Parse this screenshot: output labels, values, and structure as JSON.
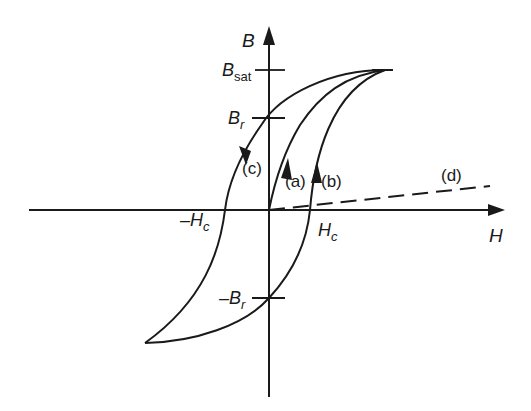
{
  "figure": {
    "axes": {
      "x_label": "H",
      "y_label": "B"
    },
    "ticks": {
      "b_sat": {
        "main": "B",
        "sub": "sat"
      },
      "b_r": {
        "main": "B",
        "sub": "r"
      },
      "neg_b_r": {
        "main": "–B",
        "sub": "r"
      },
      "h_c": {
        "main": "H",
        "sub": "c"
      },
      "neg_h_c": {
        "main": "–H",
        "sub": "c"
      }
    },
    "curve_labels": {
      "a": "(a)",
      "b": "(b)",
      "c": "(c)",
      "d": "(d)"
    },
    "colors": {
      "ink": "#1a1a1a",
      "background": "#ffffff"
    }
  }
}
